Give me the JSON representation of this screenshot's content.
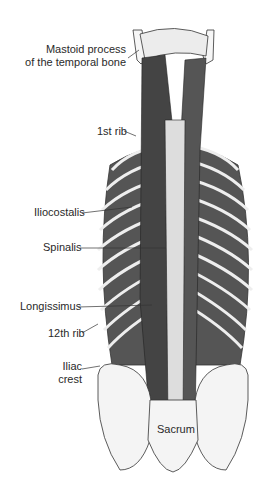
{
  "figure": {
    "labels": {
      "mastoid_line1": "Mastoid process",
      "mastoid_line2": "of the temporal bone",
      "first_rib": "1st rib",
      "iliocostalis": "Iliocostalis",
      "spinalis": "Spinalis",
      "longissimus": "Longissimus",
      "twelfth_rib": "12th rib",
      "iliac_line1": "Iliac",
      "iliac_line2": "crest",
      "sacrum": "Sacrum"
    },
    "colors": {
      "ink": "#2a2a2a",
      "muscle": "#5a5a5a",
      "bone": "#f4f4f4",
      "background": "#ffffff"
    }
  }
}
